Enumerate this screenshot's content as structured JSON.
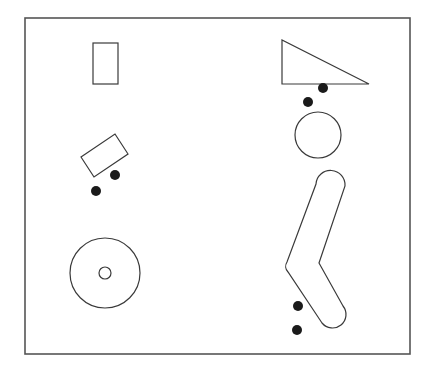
{
  "diagram": {
    "width": 429,
    "height": 372,
    "colors": {
      "stroke": "#3a3a3a",
      "frame": "#555555",
      "dot": "#1a1a1a",
      "background": "#ffffff"
    },
    "frame": {
      "x": 25,
      "y": 18,
      "width": 385,
      "height": 336
    },
    "shapes": [
      {
        "name": "rectangle",
        "type": "rect",
        "x": 93,
        "y": 43,
        "width": 25,
        "height": 41
      },
      {
        "name": "triangle",
        "type": "polygon",
        "points": "282,40 282,84 369,84"
      },
      {
        "name": "rotated-rectangle",
        "type": "polygon",
        "points": "81,157 115,134 128,154 94,177"
      },
      {
        "name": "circle",
        "type": "circle",
        "cx": 318,
        "cy": 135,
        "r": 23
      },
      {
        "name": "ring-outer",
        "type": "circle",
        "cx": 105,
        "cy": 273,
        "r": 35
      },
      {
        "name": "ring-inner",
        "type": "circle",
        "cx": 105,
        "cy": 273,
        "r": 6
      },
      {
        "name": "bent-capsule",
        "type": "path",
        "d": "M 316,184 A 14.5,14.5 0 0 1 345,186 L 319,263 L 343,306 A 13,13 0 0 1 322,323 L 288,272 A 8,8 0 0 1 287,262 Z"
      }
    ],
    "contact_points": [
      {
        "name": "triangle-contact-1",
        "cx": 323,
        "cy": 88,
        "r": 5
      },
      {
        "name": "triangle-contact-2",
        "cx": 308,
        "cy": 102,
        "r": 5
      },
      {
        "name": "rotated-rect-contact-1",
        "cx": 115,
        "cy": 175,
        "r": 5
      },
      {
        "name": "rotated-rect-contact-2",
        "cx": 96,
        "cy": 191,
        "r": 5
      },
      {
        "name": "capsule-contact-1",
        "cx": 298,
        "cy": 306,
        "r": 5
      },
      {
        "name": "capsule-contact-2",
        "cx": 297,
        "cy": 330,
        "r": 5
      }
    ]
  }
}
